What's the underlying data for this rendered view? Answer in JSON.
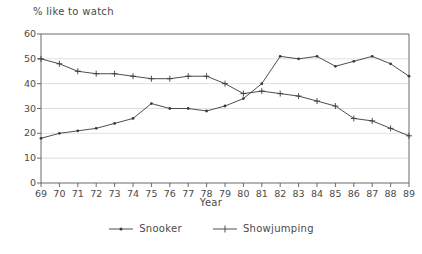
{
  "chart_data": {
    "type": "line",
    "title": "",
    "ylabel": "% like to watch",
    "xlabel": "Year",
    "x": [
      "69",
      "70",
      "71",
      "72",
      "73",
      "74",
      "75",
      "76",
      "77",
      "78",
      "79",
      "80",
      "81",
      "82",
      "83",
      "84",
      "85",
      "86",
      "87",
      "88",
      "89"
    ],
    "ylim": [
      0,
      60
    ],
    "yticks": [
      "0",
      "10",
      "20",
      "30",
      "40",
      "50",
      "60"
    ],
    "grid": true,
    "legend_position": "bottom-center",
    "series": [
      {
        "name": "Snooker",
        "marker": "dot",
        "color": "#3a3a3a",
        "values": [
          18,
          20,
          21,
          22,
          24,
          26,
          32,
          30,
          30,
          29,
          31,
          34,
          40,
          51,
          50,
          51,
          47,
          49,
          51,
          48,
          43
        ]
      },
      {
        "name": "Showjumping",
        "marker": "plus",
        "color": "#3a3a3a",
        "values": [
          50,
          48,
          45,
          44,
          44,
          43,
          42,
          42,
          43,
          43,
          40,
          36,
          37,
          36,
          35,
          33,
          31,
          26,
          25,
          22,
          19
        ]
      }
    ]
  },
  "legend": {
    "items": [
      {
        "label": "Snooker"
      },
      {
        "label": "Showjumping"
      }
    ]
  },
  "axes": {
    "y_title": "% like to watch",
    "x_title": "Year"
  }
}
